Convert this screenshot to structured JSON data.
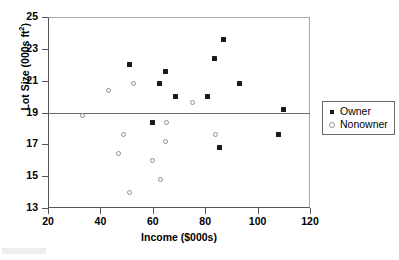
{
  "chart_data": {
    "type": "scatter",
    "title": "",
    "xlabel": "Income ($000s)",
    "ylabel_text": "Lot Size (000s ft",
    "ylabel_sup": "2",
    "ylabel_tail": ")",
    "xlim": [
      20,
      120
    ],
    "ylim": [
      13,
      25
    ],
    "xticks": [
      20,
      40,
      60,
      80,
      100,
      120
    ],
    "yticks": [
      13,
      15,
      17,
      19,
      21,
      23,
      25
    ],
    "grid": false,
    "legend_position": "right-outside",
    "reference_lines": [
      {
        "orientation": "horizontal",
        "y": 19,
        "color": "#6a6a6a"
      }
    ],
    "series": [
      {
        "name": "Owner",
        "marker": "filled-square",
        "color": "#1a1a1a",
        "points": [
          {
            "x": 51.0,
            "y": 22.0
          },
          {
            "x": 62.5,
            "y": 20.8
          },
          {
            "x": 64.8,
            "y": 21.6
          },
          {
            "x": 68.8,
            "y": 20.0
          },
          {
            "x": 81.0,
            "y": 20.0
          },
          {
            "x": 83.5,
            "y": 22.4
          },
          {
            "x": 86.8,
            "y": 23.6
          },
          {
            "x": 93.0,
            "y": 20.8
          },
          {
            "x": 110.0,
            "y": 19.2
          },
          {
            "x": 59.8,
            "y": 18.4
          },
          {
            "x": 85.5,
            "y": 16.8
          },
          {
            "x": 108.0,
            "y": 17.6
          }
        ]
      },
      {
        "name": "Nonowner",
        "marker": "open-circle",
        "color": "#8e8e8e",
        "points": [
          {
            "x": 43.2,
            "y": 20.4
          },
          {
            "x": 52.8,
            "y": 20.8
          },
          {
            "x": 75.0,
            "y": 19.6
          },
          {
            "x": 33.0,
            "y": 18.8
          },
          {
            "x": 65.4,
            "y": 18.4
          },
          {
            "x": 48.8,
            "y": 17.6
          },
          {
            "x": 64.8,
            "y": 17.2
          },
          {
            "x": 84.0,
            "y": 17.6
          },
          {
            "x": 47.0,
            "y": 16.4
          },
          {
            "x": 59.8,
            "y": 16.0
          },
          {
            "x": 62.8,
            "y": 14.8
          },
          {
            "x": 51.0,
            "y": 14.0
          }
        ]
      }
    ]
  },
  "legend": {
    "items": [
      {
        "label": "Owner",
        "marker": "filled-square"
      },
      {
        "label": "Nonowner",
        "marker": "open-circle"
      }
    ]
  }
}
